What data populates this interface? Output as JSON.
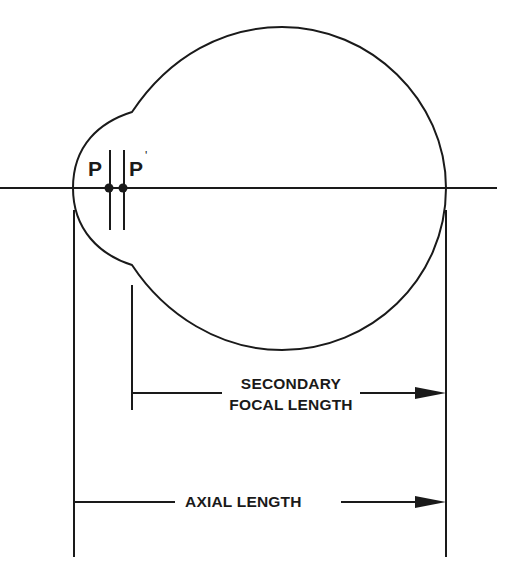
{
  "diagram": {
    "colors": {
      "stroke": "#1a1a1a",
      "background": "#ffffff"
    },
    "points": {
      "principal_point_1": "P",
      "principal_point_2": "P",
      "principal_point_2_prime": "'"
    },
    "labels": {
      "secondary_focal_length_line1": "SECONDARY",
      "secondary_focal_length_line2": "FOCAL LENGTH",
      "axial_length": "AXIAL LENGTH"
    }
  }
}
